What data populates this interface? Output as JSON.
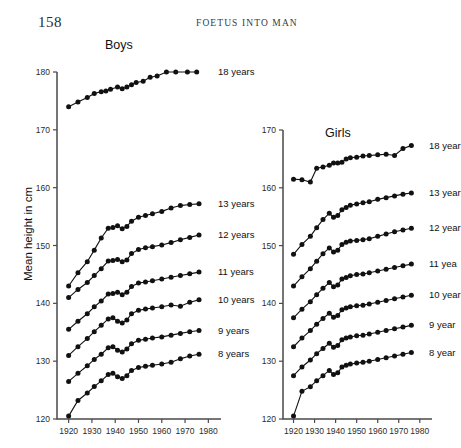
{
  "page": {
    "number": "158",
    "running_head": "FOETUS INTO MAN"
  },
  "axis_titles": {
    "y": "Mean height in cm"
  },
  "panels": {
    "boys": {
      "title": "Boys"
    },
    "girls": {
      "title": "Girls"
    }
  },
  "series_labels": {
    "boys": {
      "a18": "18 years",
      "a13": "13 years",
      "a12": "12 years",
      "a11": "11 years",
      "a10": "10 years",
      "a9": "9 years",
      "a8": "8 years"
    },
    "girls": {
      "a18": "18 year",
      "a13": "13 year",
      "a12": "12 year",
      "a11": "11 yea",
      "a10": "10 year",
      "a9": "9 year",
      "a8": "8 year"
    }
  },
  "chart_data": [
    {
      "type": "line",
      "title": "Boys",
      "xlabel": "",
      "ylabel": "Mean height in cm",
      "xlim": [
        1915,
        1982
      ],
      "ylim": [
        120,
        180
      ],
      "xticks": [
        1920,
        1930,
        1940,
        1950,
        1960,
        1970,
        1980
      ],
      "yticks": [
        120,
        130,
        140,
        150,
        160,
        170,
        180
      ],
      "grid": false,
      "legend_position": "right-inline",
      "series": [
        {
          "name": "18 years",
          "x": [
            1920,
            1924,
            1928,
            1931,
            1934,
            1936,
            1938,
            1941,
            1943,
            1945,
            1947,
            1949,
            1952,
            1955,
            1958,
            1962,
            1966,
            1971,
            1975
          ],
          "y": [
            174.0,
            174.8,
            175.6,
            176.3,
            176.6,
            176.7,
            177.0,
            177.4,
            177.1,
            177.4,
            177.8,
            178.2,
            178.4,
            179.1,
            179.3,
            180.4,
            180.6,
            180.5,
            180.4
          ]
        },
        {
          "name": "13 years",
          "x": [
            1920,
            1924,
            1928,
            1931,
            1934,
            1937,
            1939,
            1941,
            1943,
            1945,
            1947,
            1950,
            1953,
            1956,
            1960,
            1964,
            1968,
            1972,
            1976
          ],
          "y": [
            143.0,
            145.3,
            147.2,
            149.2,
            151.3,
            153.0,
            153.1,
            153.4,
            152.9,
            153.3,
            154.2,
            154.9,
            155.2,
            155.5,
            155.9,
            156.5,
            156.9,
            157.1,
            157.2
          ]
        },
        {
          "name": "12 years",
          "x": [
            1920,
            1924,
            1928,
            1931,
            1934,
            1937,
            1939,
            1941,
            1943,
            1945,
            1947,
            1950,
            1953,
            1956,
            1960,
            1964,
            1968,
            1972,
            1976
          ],
          "y": [
            141.0,
            142.4,
            143.6,
            144.8,
            146.0,
            147.3,
            147.4,
            147.6,
            147.2,
            147.5,
            148.6,
            149.3,
            149.6,
            149.8,
            150.1,
            150.5,
            151.0,
            151.4,
            151.8
          ]
        },
        {
          "name": "11 years",
          "x": [
            1920,
            1924,
            1928,
            1931,
            1934,
            1937,
            1939,
            1941,
            1943,
            1945,
            1947,
            1950,
            1953,
            1956,
            1960,
            1964,
            1968,
            1972,
            1976
          ],
          "y": [
            135.5,
            136.9,
            138.2,
            139.4,
            140.4,
            141.6,
            141.7,
            141.9,
            141.5,
            141.9,
            142.9,
            143.5,
            143.7,
            143.9,
            144.2,
            144.5,
            144.8,
            145.1,
            145.4
          ]
        },
        {
          "name": "10 years",
          "x": [
            1920,
            1924,
            1928,
            1931,
            1934,
            1937,
            1939,
            1941,
            1943,
            1945,
            1947,
            1950,
            1953,
            1956,
            1960,
            1964,
            1968,
            1972,
            1976
          ],
          "y": [
            131.0,
            132.5,
            133.9,
            135.1,
            136.2,
            137.3,
            137.5,
            136.9,
            136.6,
            137.1,
            138.2,
            138.8,
            139.0,
            139.2,
            139.4,
            139.7,
            139.5,
            140.2,
            140.6
          ]
        },
        {
          "name": "9 years",
          "x": [
            1920,
            1924,
            1928,
            1931,
            1934,
            1937,
            1939,
            1941,
            1943,
            1945,
            1947,
            1950,
            1953,
            1956,
            1960,
            1964,
            1968,
            1972,
            1976
          ],
          "y": [
            126.5,
            127.9,
            129.2,
            130.3,
            131.2,
            132.3,
            132.5,
            131.9,
            131.6,
            132.1,
            133.0,
            133.6,
            133.8,
            134.0,
            134.2,
            134.5,
            134.8,
            135.1,
            135.3
          ]
        },
        {
          "name": "8 years",
          "x": [
            1920,
            1924,
            1928,
            1931,
            1934,
            1937,
            1939,
            1941,
            1943,
            1945,
            1947,
            1950,
            1953,
            1956,
            1960,
            1964,
            1968,
            1972,
            1976
          ],
          "y": [
            120.5,
            123.2,
            124.5,
            125.6,
            126.6,
            127.7,
            127.9,
            127.3,
            127.0,
            127.5,
            128.4,
            128.9,
            129.1,
            129.3,
            129.5,
            129.8,
            130.4,
            130.9,
            131.2
          ]
        }
      ]
    },
    {
      "type": "line",
      "title": "Girls",
      "xlabel": "",
      "ylabel": "",
      "xlim": [
        1915,
        1982
      ],
      "ylim": [
        120,
        170
      ],
      "xticks": [
        1920,
        1930,
        1940,
        1950,
        1960,
        1970,
        1980
      ],
      "yticks": [
        120,
        130,
        140,
        150,
        160,
        170
      ],
      "grid": false,
      "legend_position": "right-inline",
      "series": [
        {
          "name": "18 year",
          "x": [
            1920,
            1924,
            1928,
            1931,
            1934,
            1937,
            1939,
            1941,
            1943,
            1945,
            1947,
            1950,
            1953,
            1956,
            1960,
            1964,
            1968,
            1972,
            1976
          ],
          "y": [
            161.5,
            161.4,
            161.0,
            163.4,
            163.6,
            163.9,
            164.3,
            164.3,
            164.4,
            165.0,
            165.2,
            165.3,
            165.5,
            165.6,
            165.7,
            165.8,
            165.6,
            166.8,
            167.3
          ]
        },
        {
          "name": "13 year",
          "x": [
            1920,
            1924,
            1928,
            1931,
            1934,
            1937,
            1939,
            1941,
            1943,
            1945,
            1947,
            1950,
            1953,
            1956,
            1960,
            1964,
            1968,
            1972,
            1976
          ],
          "y": [
            148.5,
            150.2,
            151.6,
            153.1,
            154.5,
            155.6,
            154.9,
            155.2,
            156.2,
            156.6,
            157.0,
            157.2,
            157.4,
            157.6,
            158.0,
            158.3,
            158.6,
            158.9,
            159.1
          ]
        },
        {
          "name": "12 year",
          "x": [
            1920,
            1924,
            1928,
            1931,
            1934,
            1937,
            1939,
            1941,
            1943,
            1945,
            1947,
            1950,
            1953,
            1956,
            1960,
            1964,
            1968,
            1972,
            1976
          ],
          "y": [
            143.0,
            144.6,
            146.0,
            147.3,
            148.6,
            149.6,
            148.9,
            149.2,
            150.2,
            150.6,
            150.8,
            150.9,
            151.0,
            151.2,
            151.6,
            152.0,
            152.4,
            152.7,
            153.0
          ]
        },
        {
          "name": "11 yea",
          "x": [
            1920,
            1924,
            1928,
            1931,
            1934,
            1937,
            1939,
            1941,
            1943,
            1945,
            1947,
            1950,
            1953,
            1956,
            1960,
            1964,
            1968,
            1972,
            1976
          ],
          "y": [
            137.5,
            139.0,
            140.3,
            141.5,
            142.6,
            143.6,
            142.9,
            143.2,
            144.2,
            144.5,
            144.8,
            145.0,
            145.1,
            145.3,
            145.6,
            145.9,
            146.2,
            146.5,
            146.8
          ]
        },
        {
          "name": "10 year",
          "x": [
            1920,
            1924,
            1928,
            1931,
            1934,
            1937,
            1939,
            1941,
            1943,
            1945,
            1947,
            1950,
            1953,
            1956,
            1960,
            1964,
            1968,
            1972,
            1976
          ],
          "y": [
            132.5,
            134.0,
            135.3,
            136.4,
            137.4,
            138.3,
            137.6,
            137.9,
            138.9,
            139.2,
            139.4,
            139.6,
            139.7,
            139.9,
            140.2,
            140.5,
            140.8,
            141.1,
            141.4
          ]
        },
        {
          "name": "9 year",
          "x": [
            1920,
            1924,
            1928,
            1931,
            1934,
            1937,
            1939,
            1941,
            1943,
            1945,
            1947,
            1950,
            1953,
            1956,
            1960,
            1964,
            1968,
            1972,
            1976
          ],
          "y": [
            127.5,
            129.0,
            130.2,
            131.3,
            132.2,
            133.1,
            132.4,
            132.7,
            133.7,
            134.0,
            134.2,
            134.4,
            134.5,
            134.7,
            135.0,
            135.3,
            135.6,
            135.9,
            136.2
          ]
        },
        {
          "name": "8 year",
          "x": [
            1920,
            1924,
            1928,
            1931,
            1934,
            1937,
            1939,
            1941,
            1943,
            1945,
            1947,
            1950,
            1953,
            1956,
            1960,
            1964,
            1968,
            1972,
            1976
          ],
          "y": [
            120.5,
            124.8,
            125.6,
            126.6,
            127.5,
            128.4,
            127.7,
            128.0,
            129.0,
            129.3,
            129.5,
            129.7,
            129.8,
            130.0,
            130.3,
            130.6,
            130.9,
            131.2,
            131.5
          ]
        }
      ]
    }
  ]
}
